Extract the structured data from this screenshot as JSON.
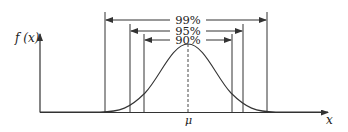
{
  "diagram": {
    "title": "",
    "y_axis_label": "f (x)",
    "x_axis_label": "x",
    "mean_label": "μ",
    "intervals": [
      {
        "label": "99%",
        "left_x": 105,
        "right_x": 267,
        "arrow_y": 20,
        "top_y": 12
      },
      {
        "label": "95%",
        "left_x": 130,
        "right_x": 243,
        "arrow_y": 31,
        "top_y": 24
      },
      {
        "label": "90%",
        "left_x": 144,
        "right_x": 232,
        "arrow_y": 40,
        "top_y": 34
      }
    ],
    "colors": {
      "line": "#333333",
      "background": "#ffffff"
    }
  }
}
